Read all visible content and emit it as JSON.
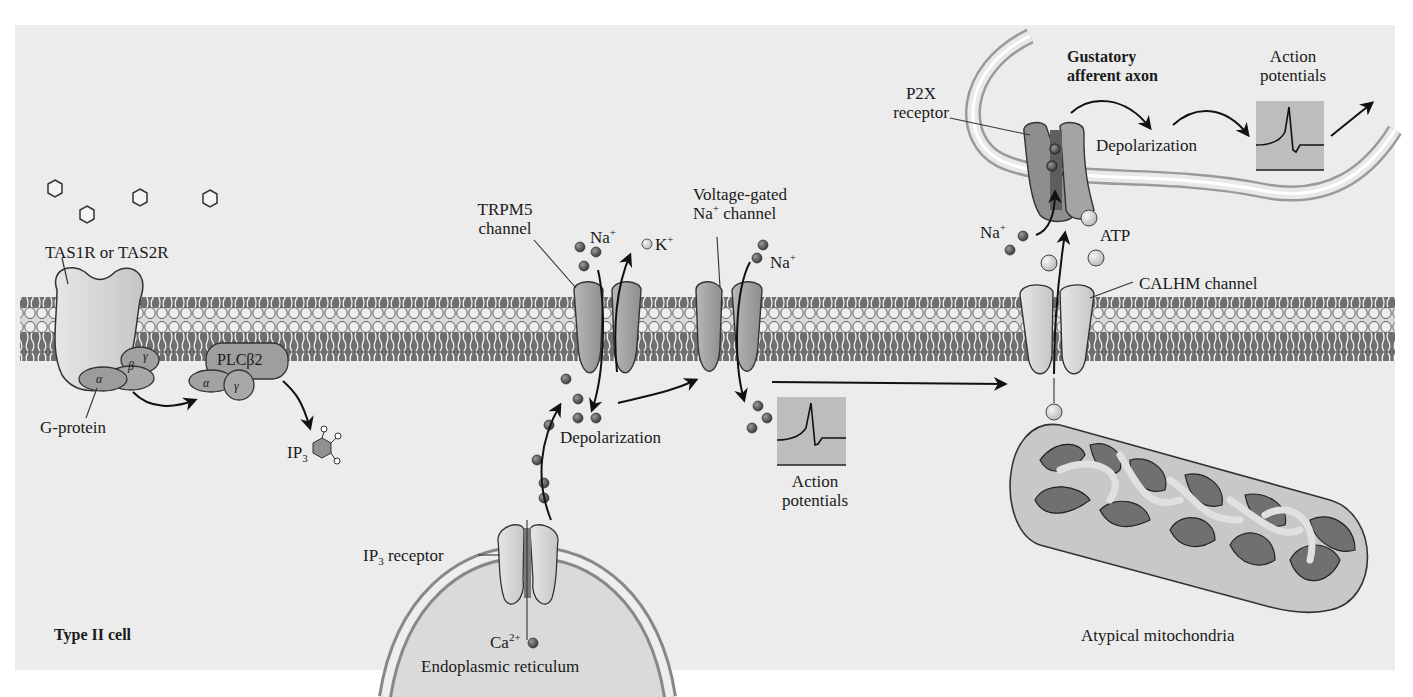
{
  "colors": {
    "panel_bg": "#ececec",
    "membrane_head": "#e2e2e2",
    "membrane_core": "#6e6e6e",
    "protein_dark": "#8a8a8a",
    "protein_light": "#d8d8d8",
    "ion_dark": "#5a5a5a",
    "ion_light": "#d4d4d4",
    "ap_box": "#bdbdbd",
    "mito_outer": "#c8c8c8",
    "mito_inner": "#6f6f6f",
    "stroke": "#222222"
  },
  "labels": {
    "receptor": "TAS1R or TAS2R",
    "g_protein": "G-protein",
    "plc": "PLCβ2",
    "alpha": "α",
    "beta": "β",
    "gamma": "γ",
    "ip3_base": "IP",
    "ip3_sub": "3",
    "trpm5_line1": "TRPM5",
    "trpm5_line2": "channel",
    "na_base": "Na",
    "plus": "+",
    "k_base": "K",
    "vgna_line1": "Voltage-gated",
    "vgna_line2_sup_before": "Na",
    "vgna_line2_after": " channel",
    "depolarization": "Depolarization",
    "ap_line1": "Action",
    "ap_line2": "potentials",
    "ip3r_base": "IP",
    "ip3r_sub": "3",
    "ip3r_after": " receptor",
    "ca_base": "Ca",
    "ca_sup": "2+",
    "er": "Endoplasmic reticulum",
    "cell_type": "Type II cell",
    "calhm": "CALHM channel",
    "atp": "ATP",
    "p2x_line1": "P2X",
    "p2x_line2": "receptor",
    "axon_line1": "Gustatory",
    "axon_line2": "afferent axon",
    "axon_depol": "Depolarization",
    "axon_ap_line1": "Action",
    "axon_ap_line2": "potentials",
    "mito": "Atypical mitochondria"
  }
}
